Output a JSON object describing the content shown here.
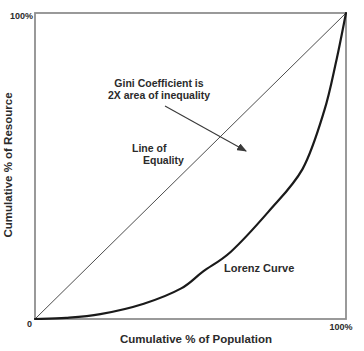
{
  "chart_data": {
    "type": "line",
    "title": "",
    "xlabel": "Cumulative % of Population",
    "ylabel": "Cumulative % of Resource",
    "xlim": [
      0,
      100
    ],
    "ylim": [
      0,
      100
    ],
    "x_tick_labels": [
      "0",
      "100%"
    ],
    "y_tick_labels": [
      "100%"
    ],
    "grid": false,
    "legend": "none",
    "series": [
      {
        "name": "line-of-equality",
        "label": "Line of Equality",
        "x": [
          0,
          100
        ],
        "y": [
          0,
          100
        ]
      },
      {
        "name": "lorenz-curve",
        "label": "Lorenz Curve",
        "x": [
          0,
          10,
          21,
          35,
          47,
          54,
          63,
          75,
          86,
          93,
          97,
          100
        ],
        "y": [
          0,
          0.4,
          1.6,
          5,
          10,
          15.5,
          22,
          35,
          49,
          68,
          85,
          100
        ]
      }
    ],
    "annotations": [
      {
        "text": "Gini Coefficient is 2X area of inequality",
        "has_arrow": true
      },
      {
        "text": "Line of Equality",
        "has_arrow": false
      },
      {
        "text": "Lorenz Curve",
        "has_arrow": false
      }
    ]
  },
  "labels": {
    "y_top_tick": "100%",
    "origin_tick": "0",
    "x_right_tick": "100%",
    "x_axis": "Cumulative % of Population",
    "y_axis": "Cumulative % of Resource",
    "gini_line1": "Gini Coefficient is",
    "gini_line2": "2X area of inequality",
    "equality_line1": "Line of",
    "equality_line2": "Equality",
    "lorenz": "Lorenz Curve"
  },
  "colors": {
    "border": "#8f8f8f",
    "equality_line": "#4d4d4d",
    "curve": "#1a1a1a",
    "annotation": "#3a3a3a",
    "text": "#2b2b2b"
  }
}
